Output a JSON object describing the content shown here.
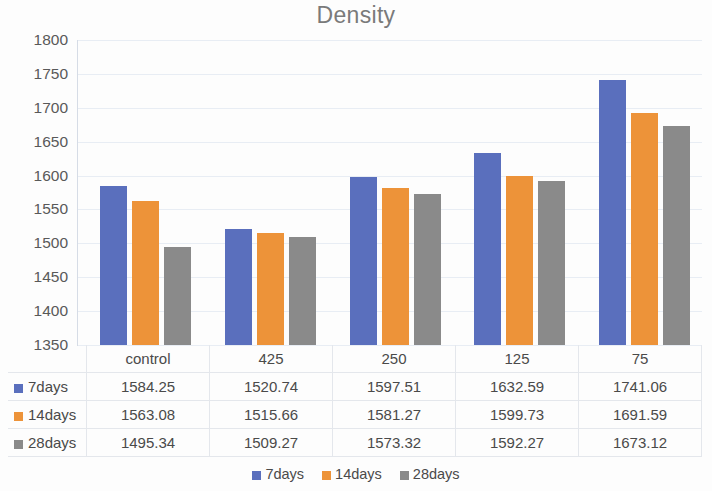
{
  "chart_data": {
    "type": "bar",
    "title": "Density",
    "xlabel": "",
    "ylabel": "",
    "ylim": [
      1350,
      1800
    ],
    "ytick_step": 50,
    "yticks": [
      1800,
      1750,
      1700,
      1650,
      1600,
      1550,
      1500,
      1450,
      1400,
      1350
    ],
    "grid": true,
    "legend_position": "bottom",
    "categories": [
      "control",
      "425",
      "250",
      "125",
      "75"
    ],
    "series": [
      {
        "name": "7days",
        "color": "#5a6fbd",
        "values": [
          1584.25,
          1520.74,
          1597.51,
          1632.59,
          1741.06
        ]
      },
      {
        "name": "14days",
        "color": "#ed9339",
        "values": [
          1563.08,
          1515.66,
          1581.27,
          1599.73,
          1691.59
        ]
      },
      {
        "name": "28days",
        "color": "#8a8a8a",
        "values": [
          1495.34,
          1509.27,
          1573.32,
          1592.27,
          1673.12
        ]
      }
    ],
    "data_table": {
      "visible": true,
      "corner_label": "",
      "column_headers": [
        "control",
        "425",
        "250",
        "125",
        "75"
      ],
      "rows": [
        {
          "label": "7days",
          "color": "#5a6fbd",
          "cells": [
            "1584.25",
            "1520.74",
            "1597.51",
            "1632.59",
            "1741.06"
          ]
        },
        {
          "label": "14days",
          "color": "#ed9339",
          "cells": [
            "1563.08",
            "1515.66",
            "1581.27",
            "1599.73",
            "1691.59"
          ]
        },
        {
          "label": "28days",
          "color": "#8a8a8a",
          "cells": [
            "1495.34",
            "1509.27",
            "1573.32",
            "1592.27",
            "1673.12"
          ]
        }
      ]
    },
    "legend": [
      {
        "label": "7days",
        "color": "#5a6fbd"
      },
      {
        "label": "14days",
        "color": "#ed9339"
      },
      {
        "label": "28days",
        "color": "#8a8a8a"
      }
    ]
  }
}
